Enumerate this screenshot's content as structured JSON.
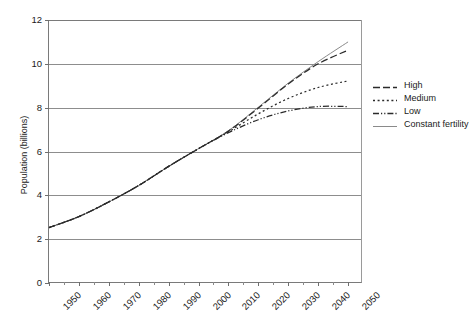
{
  "chart_data": {
    "type": "line",
    "title": "",
    "xlabel": "",
    "ylabel": "Population (billions)",
    "xlim": [
      1950,
      2055
    ],
    "ylim": [
      0,
      12
    ],
    "ytick_labels": [
      "0",
      "2",
      "4",
      "6",
      "8",
      "10",
      "12"
    ],
    "ytick_values": [
      0,
      2,
      4,
      6,
      8,
      10,
      12
    ],
    "xtick_labels": [
      "1950",
      "1960",
      "1970",
      "1980",
      "1990",
      "2000",
      "2010",
      "2020",
      "2030",
      "2040",
      "2050"
    ],
    "xtick_values": [
      1950,
      1960,
      1970,
      1980,
      1990,
      2000,
      2010,
      2020,
      2030,
      2040,
      2050
    ],
    "minor_xtick_values": [
      1955,
      1965,
      1975,
      1985,
      1995,
      2005,
      2015,
      2025,
      2035,
      2045
    ],
    "grid": "horizontal",
    "legend_position": "right",
    "x": [
      1950,
      1960,
      1970,
      1980,
      1990,
      2000,
      2010,
      2020,
      2030,
      2040,
      2050
    ],
    "series": [
      {
        "name": "High",
        "style": "dashed",
        "color": "#2b2b2b",
        "values": [
          2.53,
          3.03,
          3.7,
          4.45,
          5.32,
          6.13,
          6.93,
          7.98,
          9.08,
          10.0,
          10.62
        ]
      },
      {
        "name": "Medium",
        "style": "dotted",
        "color": "#2b2b2b",
        "values": [
          2.53,
          3.03,
          3.7,
          4.45,
          5.32,
          6.13,
          6.9,
          7.72,
          8.42,
          8.92,
          9.22
        ]
      },
      {
        "name": "Low",
        "style": "dash-dot-dot",
        "color": "#2b2b2b",
        "values": [
          2.53,
          3.03,
          3.7,
          4.45,
          5.32,
          6.13,
          6.86,
          7.45,
          7.85,
          8.05,
          8.05
        ]
      },
      {
        "name": "Constant fertility",
        "style": "solid",
        "color": "#8a8a8a",
        "values": [
          2.53,
          3.03,
          3.7,
          4.45,
          5.32,
          6.13,
          6.95,
          8.02,
          9.12,
          10.1,
          11.0
        ]
      }
    ]
  },
  "legend": {
    "items": [
      {
        "label": "High"
      },
      {
        "label": "Medium"
      },
      {
        "label": "Low"
      },
      {
        "label": "Constant fertility"
      }
    ]
  },
  "axis": {
    "y_title": "Population (billions)"
  }
}
